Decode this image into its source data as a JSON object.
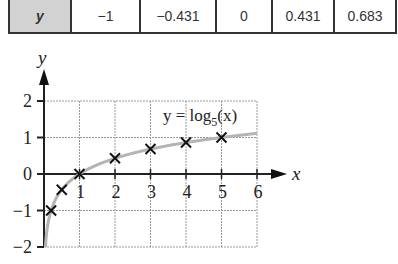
{
  "table": {
    "row_label": "y",
    "values": [
      "−1",
      "−0.431",
      "0",
      "0.431",
      "0.683"
    ],
    "widths": [
      69,
      76,
      56,
      62,
      58
    ]
  },
  "chart_data": {
    "type": "line",
    "title": "",
    "xlabel": "x",
    "ylabel": "y",
    "xlim": [
      0,
      6
    ],
    "ylim": [
      -2,
      2
    ],
    "grid": true,
    "x_ticks": [
      "1",
      "2",
      "3",
      "4",
      "5",
      "6"
    ],
    "y_ticks": [
      "2",
      "1",
      "0",
      "−1",
      "−2"
    ],
    "annotation": {
      "text_main": "y = log",
      "text_sub": "5",
      "text_tail": "(x)"
    },
    "series": [
      {
        "name": "y = log5(x)",
        "style": "curve",
        "color": "#b0b0b0"
      },
      {
        "name": "plotted points",
        "style": "cross-markers",
        "color": "#111111",
        "x": [
          0.2,
          0.5,
          1,
          2,
          3,
          4,
          5
        ],
        "y": [
          -1,
          -0.431,
          0,
          0.431,
          0.683,
          0.861,
          1
        ]
      }
    ]
  }
}
